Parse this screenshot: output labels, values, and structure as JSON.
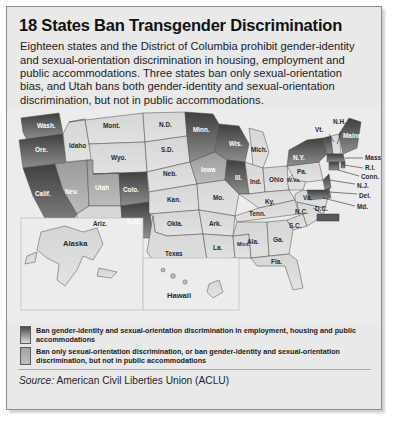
{
  "title": "18 States Ban Transgender Discrimination",
  "blurb": "Eighteen states and the District of Columbia prohibit gender-identity and sexual-orientation discrimination in housing, employment and public accommodations. Three states ban only sexual-orientation bias, and Utah bans both gender-identity and sexual-orientation discrimination, but not in public accommodations.",
  "legend": [
    {
      "swatch": "dark-gradient-swatch",
      "text": "Ban gender-identity and sexual-orientation discrimination in employment, housing and public accommodations"
    },
    {
      "swatch": "mid-gray-swatch",
      "text": "Ban only sexual-orientation discrimination, or ban gender-identity and sexual-orientation discrimination, but not in public accommodations"
    }
  ],
  "source": {
    "label": "Source:",
    "value": "American Civil Liberties Union (ACLU)"
  },
  "colors": {
    "card_bg": "#e9e9e9",
    "ocean": "#ececed",
    "full_ban_dark": "#5a5a5a",
    "partial_ban_mid": "#a8a8a8",
    "no_ban_light": "#d8d8d8",
    "border": "#8d8d8d"
  },
  "map": {
    "inset_labels": [
      "Alaska",
      "Hawaii"
    ],
    "dc_label": "D.C.",
    "states": [
      {
        "abbr": "Wash.",
        "category": "full"
      },
      {
        "abbr": "Ore.",
        "category": "full"
      },
      {
        "abbr": "Calif.",
        "category": "full"
      },
      {
        "abbr": "Nev.",
        "category": "partial"
      },
      {
        "abbr": "Idaho",
        "category": "none"
      },
      {
        "abbr": "Mont.",
        "category": "none"
      },
      {
        "abbr": "Wyo.",
        "category": "none"
      },
      {
        "abbr": "Utah",
        "category": "partial"
      },
      {
        "abbr": "Ariz.",
        "category": "none"
      },
      {
        "abbr": "Colo.",
        "category": "full"
      },
      {
        "abbr": "N.M.",
        "category": "full"
      },
      {
        "abbr": "N.D.",
        "category": "none"
      },
      {
        "abbr": "S.D.",
        "category": "none"
      },
      {
        "abbr": "Neb.",
        "category": "none"
      },
      {
        "abbr": "Kan.",
        "category": "none"
      },
      {
        "abbr": "Okla.",
        "category": "none"
      },
      {
        "abbr": "Texas",
        "category": "none"
      },
      {
        "abbr": "Minn.",
        "category": "full"
      },
      {
        "abbr": "Iowa",
        "category": "partial"
      },
      {
        "abbr": "Mo.",
        "category": "none"
      },
      {
        "abbr": "Ark.",
        "category": "none"
      },
      {
        "abbr": "La.",
        "category": "none"
      },
      {
        "abbr": "Wis.",
        "category": "full"
      },
      {
        "abbr": "Ill.",
        "category": "full"
      },
      {
        "abbr": "Miss.",
        "category": "none"
      },
      {
        "abbr": "Mich.",
        "category": "none"
      },
      {
        "abbr": "Ind.",
        "category": "none"
      },
      {
        "abbr": "Ohio",
        "category": "none"
      },
      {
        "abbr": "Ky.",
        "category": "none"
      },
      {
        "abbr": "Tenn.",
        "category": "none"
      },
      {
        "abbr": "Ala.",
        "category": "none"
      },
      {
        "abbr": "Ga.",
        "category": "none"
      },
      {
        "abbr": "Fla.",
        "category": "none"
      },
      {
        "abbr": "S.C.",
        "category": "none"
      },
      {
        "abbr": "N.C.",
        "category": "none"
      },
      {
        "abbr": "Va.",
        "category": "none"
      },
      {
        "abbr": "W.Va.",
        "category": "none"
      },
      {
        "abbr": "Pa.",
        "category": "none"
      },
      {
        "abbr": "N.Y.",
        "category": "full"
      },
      {
        "abbr": "Vt.",
        "category": "full"
      },
      {
        "abbr": "N.H.",
        "category": "none"
      },
      {
        "abbr": "Maine",
        "category": "full"
      },
      {
        "abbr": "Mass.",
        "category": "full"
      },
      {
        "abbr": "R.I.",
        "category": "full"
      },
      {
        "abbr": "Conn.",
        "category": "full"
      },
      {
        "abbr": "N.J.",
        "category": "full"
      },
      {
        "abbr": "Del.",
        "category": "full"
      },
      {
        "abbr": "Md.",
        "category": "full"
      },
      {
        "abbr": "D.C.",
        "category": "full"
      },
      {
        "abbr": "Alaska",
        "category": "none"
      },
      {
        "abbr": "Hawaii",
        "category": "none"
      }
    ]
  }
}
